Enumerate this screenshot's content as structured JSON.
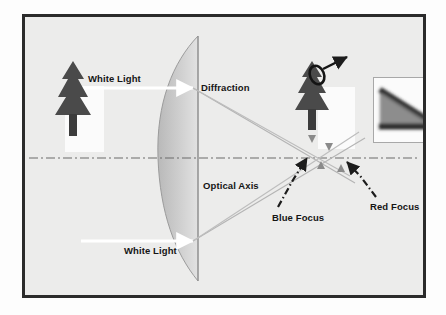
{
  "figure": {
    "caption": "Chromatic Aberration",
    "frame_border_color": "#2b2b2b",
    "background_color": "#ececeb"
  },
  "labels": {
    "white_light_top": "White Light",
    "white_light_bottom": "White Light",
    "diffraction": "Diffraction",
    "optical_axis": "Optical Axis",
    "blue_focus": "Blue Focus",
    "red_focus": "Red Focus"
  },
  "elements": {
    "lens_name": "plano-convex-lens",
    "lens_fill_color": "#c9c9c9",
    "object_tree_color": "#4a4a4a",
    "ray_color": "#b0b0b0",
    "axis_color": "#6a6a6a",
    "focus_arrow_color": "#1c1c1c",
    "white_arrow_color": "#ffffff",
    "inset_border_color": "#a8a8a8"
  },
  "diagram_data": {
    "type": "optics-ray-diagram",
    "subject": "Chromatic aberration through a plano-convex lens",
    "optical_axis_y": 141,
    "lens_flat_edge_x": 173,
    "focus_points": [
      {
        "name": "Blue Focus",
        "x": 283,
        "y": 138
      },
      {
        "name": "Red Focus",
        "x": 320,
        "y": 146
      }
    ],
    "incoming_beams": [
      {
        "name": "white-light-upper",
        "y": 71
      },
      {
        "name": "white-light-lower",
        "y": 224
      }
    ]
  }
}
